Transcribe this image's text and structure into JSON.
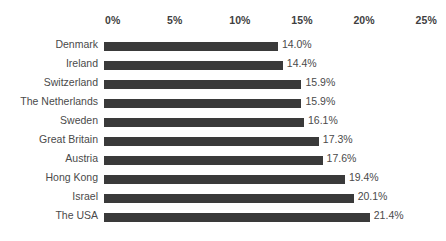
{
  "chart_data": {
    "type": "bar",
    "orientation": "horizontal",
    "title": "",
    "subtitle": "",
    "xlabel": "",
    "ylabel": "",
    "xlim": [
      0,
      25
    ],
    "grid": false,
    "legend": false,
    "bar_color": "#3a3a3a",
    "background_color": "#ffffff",
    "label_color": "#4a4a4a",
    "tick_color": "#3f3f3f",
    "tick_labels": [
      "0%",
      "5%",
      "10%",
      "15%",
      "20%",
      "25%"
    ],
    "ticks": [
      0,
      5,
      10,
      15,
      20,
      25
    ],
    "categories": [
      "Denmark",
      "Ireland",
      "Switzerland",
      "The Netherlands",
      "Sweden",
      "Great Britain",
      "Austria",
      "Hong Kong",
      "Israel",
      "The USA"
    ],
    "values": [
      14.0,
      14.4,
      15.9,
      15.9,
      16.1,
      17.3,
      17.6,
      19.4,
      20.1,
      21.4
    ],
    "value_labels": [
      "14.0%",
      "14.4%",
      "15.9%",
      "15.9%",
      "16.1%",
      "17.3%",
      "17.6%",
      "19.4%",
      "20.1%",
      "21.4%"
    ]
  }
}
